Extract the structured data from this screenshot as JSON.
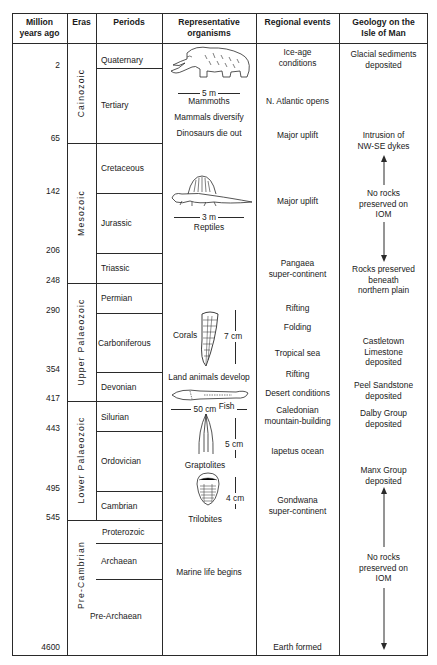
{
  "headers": {
    "mya": "Million years ago",
    "mya_l1": "Million",
    "mya_l2": "years ago",
    "eras": "Eras",
    "periods": "Periods",
    "organisms_l1": "Representative",
    "organisms_l2": "organisms",
    "events": "Regional events",
    "geology_l1": "Geology on the",
    "geology_l2": "Isle of Man"
  },
  "ages": [
    "2",
    "65",
    "142",
    "206",
    "248",
    "290",
    "354",
    "417",
    "443",
    "495",
    "545",
    "4600"
  ],
  "eras": [
    "Cainozoic",
    "Mesozoic",
    "Upper Palaeozoic",
    "Lower Palaeozoic",
    "Pre-Cambrian"
  ],
  "periods": [
    "Quaternary",
    "Tertiary",
    "Cretaceous",
    "Jurassic",
    "Triassic",
    "Permian",
    "Carboniferous",
    "Devonian",
    "Silurian",
    "Ordovician",
    "Cambrian",
    "Proterozoic",
    "Archaean",
    "Pre-Archaean"
  ],
  "organisms": {
    "mammoth_scale": "5 m",
    "mammoth_label": "Mammoths",
    "mammals_diversify": "Mammals diversify",
    "dinosaurs_die_out": "Dinosaurs die out",
    "reptile_scale": "3 m",
    "reptile_label": "Reptiles",
    "corals_label": "Corals",
    "corals_scale": "7 cm",
    "land_animals": "Land animals develop",
    "fish_label": "Fish",
    "fish_scale": "50 cm",
    "graptolites_label": "Graptolites",
    "graptolites_scale": "5 cm",
    "trilobites_label": "Trilobites",
    "trilobites_scale": "4 cm",
    "marine_life": "Marine life begins"
  },
  "events": {
    "ice_age_l1": "Ice-age",
    "ice_age_l2": "conditions",
    "atlantic": "N. Atlantic opens",
    "uplift1": "Major uplift",
    "uplift2": "Major uplift",
    "pangaea_l1": "Pangaea",
    "pangaea_l2": "super-continent",
    "rifting1": "Rifting",
    "folding": "Folding",
    "tropical": "Tropical sea",
    "rifting2": "Rifting",
    "desert": "Desert conditions",
    "caledonian_l1": "Caledonian",
    "caledonian_l2": "mountain-building",
    "iapetus": "Iapetus ocean",
    "gondwana_l1": "Gondwana",
    "gondwana_l2": "super-continent",
    "earth_formed": "Earth formed"
  },
  "geology": {
    "glacial_l1": "Glacial sediments",
    "glacial_l2": "deposited",
    "intrusion_l1": "Intrusion of",
    "intrusion_l2": "NW-SE dykes",
    "norocks1_l1": "No rocks",
    "norocks1_l2": "preserved on",
    "norocks1_l3": "IOM",
    "rocks_l1": "Rocks preserved",
    "rocks_l2": "beneath",
    "rocks_l3": "northern plain",
    "castletown_l1": "Castletown",
    "castletown_l2": "Limestone",
    "castletown_l3": "deposited",
    "peel_l1": "Peel Sandstone",
    "peel_l2": "deposited",
    "dalby_l1": "Dalby Group",
    "dalby_l2": "deposited",
    "manx_l1": "Manx Group",
    "manx_l2": "deposited",
    "norocks2_l1": "No rocks",
    "norocks2_l2": "preserved on",
    "norocks2_l3": "IOM"
  },
  "colors": {
    "line": "#2a2a2a",
    "text": "#1a1a1a",
    "background": "#ffffff"
  }
}
